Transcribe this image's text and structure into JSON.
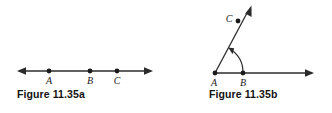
{
  "page": {
    "background_color": "#ffffff",
    "stroke_color": "#2b2b2b",
    "label_color": "#1a1a1a"
  },
  "figures": [
    {
      "id": "figure-a",
      "caption": "Figure 11.35a",
      "kind": "line",
      "description": "A straight line with arrowheads on both ends containing three marked points labeled A, B and C.",
      "points": [
        {
          "label": "A",
          "x": 49,
          "y": 71
        },
        {
          "label": "B",
          "x": 90,
          "y": 71
        },
        {
          "label": "C",
          "x": 117,
          "y": 71
        }
      ],
      "line": {
        "x1": 18,
        "y1": 71,
        "x2": 152,
        "y2": 71
      },
      "arrowheads": [
        "left",
        "right"
      ]
    },
    {
      "id": "figure-b",
      "caption": "Figure 11.35b",
      "kind": "angle",
      "description": "An angle with vertex A, a horizontal ray through B with an arrowhead, and a slanted ray through C with an arrowhead, plus an arc marking the angle.",
      "points": [
        {
          "label": "A",
          "x": 215,
          "y": 73
        },
        {
          "label": "B",
          "x": 243,
          "y": 73
        },
        {
          "label": "C",
          "x": 238,
          "y": 21
        }
      ],
      "rays": [
        {
          "name": "ray-ab",
          "x1": 215,
          "y1": 73,
          "x2": 313,
          "y2": 73,
          "arrowhead": "right"
        },
        {
          "name": "ray-ac",
          "x1": 215,
          "y1": 73,
          "x2": 251,
          "y2": 9,
          "arrowhead": "end"
        }
      ],
      "angle_arc": {
        "cx": 215,
        "cy": 73,
        "radius": 28,
        "start_deg": 0,
        "end_deg": 60,
        "arrowhead": "end"
      }
    }
  ]
}
